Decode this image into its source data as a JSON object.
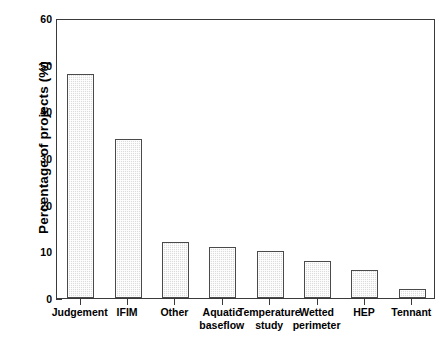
{
  "chart_data": {
    "type": "bar",
    "title": "",
    "xlabel": "",
    "ylabel": "Percentage of projects (%)",
    "categories": [
      "Judgement",
      "IFIM",
      "Other",
      "Aquatic baseflow",
      "Temperature study",
      "Wetted perimeter",
      "HEP",
      "Tennant"
    ],
    "category_lines": [
      [
        "Judgement"
      ],
      [
        "IFIM"
      ],
      [
        "Other"
      ],
      [
        "Aquatic",
        "baseflow"
      ],
      [
        "Temperature",
        "study"
      ],
      [
        "Wetted",
        "perimeter"
      ],
      [
        "HEP"
      ],
      [
        "Tennant"
      ]
    ],
    "values": [
      48,
      34,
      12,
      11,
      10,
      8,
      6,
      2
    ],
    "ylim": [
      0,
      60
    ],
    "ytick_labels": [
      "0",
      "10",
      "20",
      "30",
      "40",
      "50",
      "60"
    ],
    "ytick_values": [
      0,
      10,
      20,
      30,
      40,
      50,
      60
    ],
    "yminor_values": [
      5,
      15,
      25,
      35,
      45,
      55
    ],
    "grid": false,
    "legend": false,
    "bar_fill_color": "#dcdcdc",
    "bar_edge_color": "#4a4a4a",
    "axis_color": "#3a3a3a",
    "background_color": "#ffffff"
  }
}
